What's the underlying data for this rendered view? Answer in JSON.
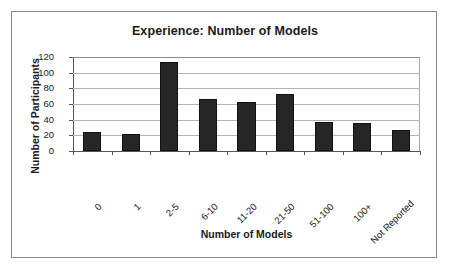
{
  "chart_data": {
    "type": "bar",
    "title": "Experience: Number of Models",
    "xlabel": "Number of Models",
    "ylabel": "Number of Participants",
    "categories": [
      "0",
      "1",
      "2-5",
      "6-10",
      "11-20",
      "21-50",
      "51-100",
      "100+",
      "Not Reported"
    ],
    "values": [
      24,
      22,
      113,
      67,
      63,
      73,
      37,
      36,
      27
    ],
    "ylim": [
      0,
      120
    ],
    "yticks": [
      0,
      20,
      40,
      60,
      80,
      100,
      120
    ],
    "grid": true,
    "legend": false,
    "bar_color": "#262626",
    "xtick_rotation": -45
  }
}
